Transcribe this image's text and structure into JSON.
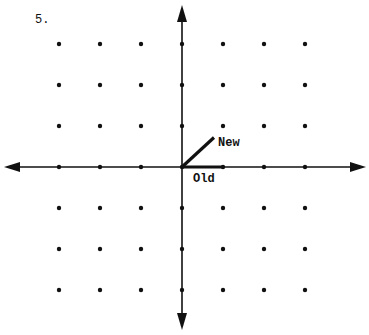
{
  "problem_number": "5.",
  "grid": {
    "origin_px": [
      182,
      167
    ],
    "spacing_px": 41,
    "x_range": [
      -3,
      3
    ],
    "y_range": [
      -3,
      3
    ]
  },
  "vectors": {
    "old": {
      "label": "Old",
      "from": [
        0,
        0
      ],
      "to": [
        1,
        0
      ]
    },
    "new": {
      "label": "New",
      "from": [
        0,
        0
      ],
      "to": [
        0.78,
        0.72
      ]
    }
  },
  "colors": {
    "ink": "#111111",
    "background": "#ffffff"
  }
}
